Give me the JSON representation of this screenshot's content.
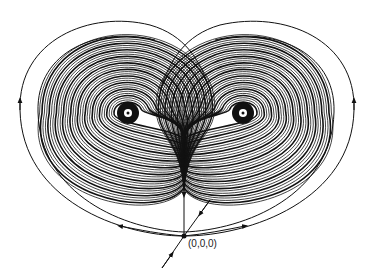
{
  "diagram": {
    "type": "Lorenz attractor phase portrait",
    "fixed_points": [
      {
        "name": "left-focus",
        "x": 128,
        "y": 113
      },
      {
        "name": "right-focus",
        "x": 243,
        "y": 113
      }
    ],
    "origin": {
      "label": "(0,0,0)",
      "x": 184,
      "y": 236
    },
    "colors": {
      "line": "#111111",
      "background": "#ffffff"
    }
  }
}
